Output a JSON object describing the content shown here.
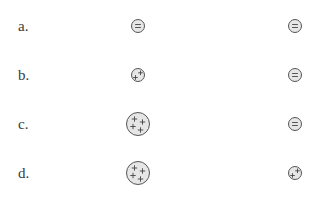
{
  "colors": {
    "sphere_fill": "#e6e6e6",
    "sphere_stroke": "#555555",
    "sign_color": "#444444",
    "label_color": "#3a3a3a"
  },
  "rows": [
    {
      "label": "a.",
      "left": {
        "size": "small",
        "charge": "negative",
        "signs": [
          "-",
          "-"
        ]
      },
      "right": {
        "size": "small",
        "charge": "negative",
        "signs": [
          "-",
          "-"
        ]
      }
    },
    {
      "label": "b.",
      "left": {
        "size": "small",
        "charge": "positive",
        "signs": [
          "+",
          "+"
        ]
      },
      "right": {
        "size": "small",
        "charge": "negative",
        "signs": [
          "-",
          "-"
        ]
      }
    },
    {
      "label": "c.",
      "left": {
        "size": "large",
        "charge": "positive",
        "signs": [
          "+",
          "+",
          "+",
          "+"
        ]
      },
      "right": {
        "size": "small",
        "charge": "negative",
        "signs": [
          "-",
          "-"
        ]
      }
    },
    {
      "label": "d.",
      "left": {
        "size": "large",
        "charge": "positive",
        "signs": [
          "+",
          "+",
          "+",
          "+"
        ]
      },
      "right": {
        "size": "small",
        "charge": "positive",
        "signs": [
          "+",
          "+"
        ]
      }
    }
  ]
}
